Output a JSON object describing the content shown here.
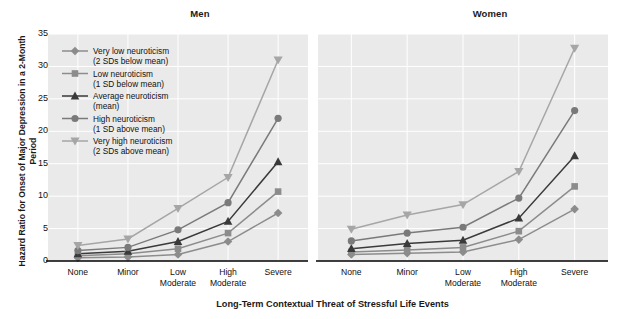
{
  "figure": {
    "ylabel": "Hazard Ratio for Onset of Major Depression in a 2-Month Period",
    "xlabel": "Long-Term Contextual Threat of Stressful Life Events"
  },
  "chart_data": {
    "type": "line",
    "title": "",
    "xlabel": "Long-Term Contextual Threat of Stressful Life Events",
    "ylabel": "Hazard Ratio for Onset of Major Depression in a 2-Month Period",
    "ylim": [
      0,
      35
    ],
    "yticks": [
      0,
      5,
      10,
      15,
      20,
      25,
      30,
      35
    ],
    "grid": true,
    "legend_position": "upper-left-inside-men-panel",
    "categories": [
      "None",
      "Minor",
      "Low Moderate",
      "High Moderate",
      "Severe"
    ],
    "category_lines": [
      [
        "None"
      ],
      [
        "Minor"
      ],
      [
        "Low",
        "Moderate"
      ],
      [
        "High",
        "Moderate"
      ],
      [
        "Severe"
      ]
    ],
    "panels": [
      {
        "name": "Men",
        "series": [
          {
            "name": "Very low neuroticism (2 SDs below mean)",
            "marker": "diamond",
            "color": "#8c8c8c",
            "values": [
              0.5,
              0.6,
              1.0,
              3.0,
              7.4
            ]
          },
          {
            "name": "Low neuroticism (1 SD below mean)",
            "marker": "square",
            "color": "#8c8c8c",
            "values": [
              0.8,
              1.1,
              1.9,
              4.3,
              10.7
            ]
          },
          {
            "name": "Average neuroticism (mean)",
            "marker": "triangle",
            "color": "#3a3a3a",
            "values": [
              1.1,
              1.5,
              3.0,
              6.1,
              15.3
            ]
          },
          {
            "name": "High neuroticism (1 SD above mean)",
            "marker": "circle",
            "color": "#7a7a7a",
            "values": [
              1.6,
              2.1,
              4.8,
              9.0,
              22.0
            ]
          },
          {
            "name": "Very high neuroticism (2 SDs above mean)",
            "marker": "triangle-down",
            "color": "#a6a6a6",
            "values": [
              2.4,
              3.4,
              8.1,
              12.9,
              31.0
            ]
          }
        ]
      },
      {
        "name": "Women",
        "series": [
          {
            "name": "Very low neuroticism (2 SDs below mean)",
            "marker": "diamond",
            "color": "#8c8c8c",
            "values": [
              1.0,
              1.2,
              1.4,
              3.3,
              8.0
            ]
          },
          {
            "name": "Low neuroticism (1 SD below mean)",
            "marker": "square",
            "color": "#8c8c8c",
            "values": [
              1.4,
              1.7,
              2.1,
              4.6,
              11.5
            ]
          },
          {
            "name": "Average neuroticism (mean)",
            "marker": "triangle",
            "color": "#3a3a3a",
            "values": [
              1.9,
              2.7,
              3.2,
              6.6,
              16.2
            ]
          },
          {
            "name": "High neuroticism (1 SD above mean)",
            "marker": "circle",
            "color": "#7a7a7a",
            "values": [
              3.1,
              4.3,
              5.2,
              9.7,
              23.2
            ]
          },
          {
            "name": "Very high neuroticism (2 SDs above mean)",
            "marker": "triangle-down",
            "color": "#a6a6a6",
            "values": [
              4.9,
              7.1,
              8.7,
              13.8,
              32.8
            ]
          }
        ]
      }
    ],
    "legend": [
      {
        "marker": "diamond",
        "color": "#8c8c8c",
        "line1": "Very low neuroticism",
        "line2": "(2 SDs below mean)"
      },
      {
        "marker": "square",
        "color": "#8c8c8c",
        "line1": "Low neuroticism",
        "line2": "(1 SD below mean)"
      },
      {
        "marker": "triangle",
        "color": "#3a3a3a",
        "line1": "Average neuroticism",
        "line2": "(mean)"
      },
      {
        "marker": "circle",
        "color": "#7a7a7a",
        "line1": "High neuroticism",
        "line2": "(1 SD above mean)"
      },
      {
        "marker": "triangle-down",
        "color": "#a6a6a6",
        "line1": "Very high neuroticism",
        "line2": "(2 SDs above mean)"
      }
    ]
  },
  "panel_titles": {
    "men": "Men",
    "women": "Women"
  },
  "ytick_labels": [
    "0",
    "5",
    "10",
    "15",
    "20",
    "25",
    "30",
    "35"
  ]
}
